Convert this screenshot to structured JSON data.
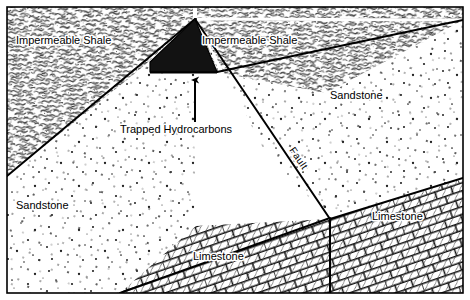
{
  "figure": {
    "width": 470,
    "height": 300,
    "frame": {
      "x": 6,
      "y": 6,
      "width": 458,
      "height": 288,
      "stroke": "#000000"
    },
    "background": "#ffffff"
  },
  "colors": {
    "ink": "#000000",
    "paper": "#ffffff",
    "hydrocarbon_fill": "#121212",
    "shale_tone": "#4a4a4a",
    "sandstone_tone": "#222222",
    "limestone_tone": "#1a1a1a"
  },
  "units": [
    {
      "id": "shale-left",
      "label": "Impermeable Shale",
      "lithology": "shale",
      "label_x": 16,
      "label_y": 44,
      "polygon": "7,7 193,7 193,19 148,62 22,175 7,175"
    },
    {
      "id": "shale-right",
      "label": "Impermeable Shale",
      "lithology": "shale",
      "label_x": 202,
      "label_y": 44,
      "polygon": "197,7 463,7 463,20 326,93 217,72 197,19"
    },
    {
      "id": "sandstone-left",
      "label": "Sandstone",
      "lithology": "sandstone",
      "label_x": 16,
      "label_y": 209,
      "polygon": "7,176 148,63 193,20 195,63 195,225 120,293 7,293"
    },
    {
      "id": "sandstone-right",
      "label": "Sandstone",
      "lithology": "sandstone",
      "label_x": 330,
      "label_y": 99,
      "polygon": "197,20 219,73 327,94 463,21 463,178 330,218 268,158"
    },
    {
      "id": "limestone-left",
      "label": "Limestone",
      "lithology": "limestone",
      "label_x": 193,
      "label_y": 260,
      "polygon": "120,293 196,226 330,219 330,293"
    },
    {
      "id": "limestone-right",
      "label": "Limestone",
      "lithology": "limestone",
      "label_x": 372,
      "label_y": 220,
      "polygon": "330,219 463,179 463,293 330,293"
    }
  ],
  "hydrocarbon_trap": {
    "label": "Trapped Hydrocarbons",
    "label_x": 120,
    "label_y": 133,
    "polygon": "195,19 217,72 150,72 150,62",
    "fill": "#121212"
  },
  "arrow": {
    "name": "hydrocarbon-pointer",
    "tail_x": 195,
    "tail_y": 122,
    "head_x": 195,
    "head_y": 74
  },
  "fault": {
    "label": "Fault",
    "label_x": 289,
    "label_y": 150,
    "rotation_deg": 48,
    "segments": [
      {
        "x1": 195,
        "y1": 19,
        "x2": 330,
        "y2": 219
      },
      {
        "x1": 330,
        "y1": 219,
        "x2": 330,
        "y2": 293
      }
    ]
  },
  "contacts": [
    {
      "name": "shale-sandstone-left",
      "x1": 7,
      "y1": 176,
      "x2": 195,
      "y2": 19
    },
    {
      "name": "shale-sandstone-right",
      "x1": 197,
      "y1": 19,
      "x2": 463,
      "y2": 20
    },
    {
      "name": "trap-base",
      "x1": 150,
      "y1": 72,
      "x2": 217,
      "y2": 72
    },
    {
      "name": "sandstone-limestone-left",
      "x1": 120,
      "y1": 293,
      "x2": 330,
      "y2": 218
    },
    {
      "name": "sandstone-limestone-right",
      "x1": 330,
      "y1": 219,
      "x2": 463,
      "y2": 178
    }
  ]
}
